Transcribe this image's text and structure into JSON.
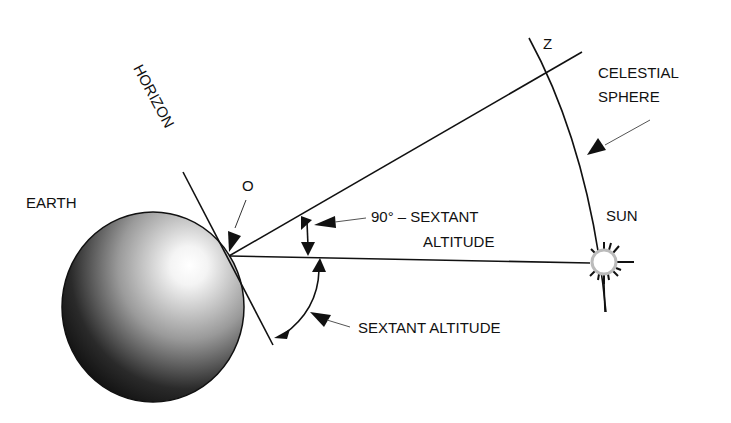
{
  "diagram": {
    "type": "celestial-navigation-geometry",
    "labels": {
      "earth": "EARTH",
      "horizon": "HORIZON",
      "observer": "O",
      "zenith": "Z",
      "celestial_sphere_line1": "CELESTIAL",
      "celestial_sphere_line2": "SPHERE",
      "sun": "SUN",
      "complement_line1": "90° – SEXTANT",
      "complement_line2": "ALTITUDE",
      "sextant_altitude": "SEXTANT ALTITUDE"
    },
    "colors": {
      "line": "#111111",
      "background": "#ffffff",
      "earth_dark": "#0a0a0a",
      "earth_light": "#ffffff"
    }
  }
}
